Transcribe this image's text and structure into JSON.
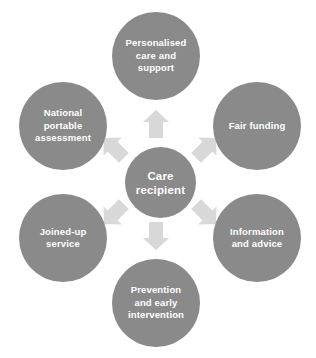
{
  "diagram": {
    "colors": {
      "circle_fill": "#8a8a8a",
      "label_text": "#ffffff",
      "arrow_fill": "#d8d8d8",
      "background": "#ffffff"
    },
    "center": {
      "id": "care-recipient",
      "label": "Care\nrecipient"
    },
    "nodes": [
      {
        "id": "personalised-care-and-support",
        "label": "Personalised\ncare and\nsupport",
        "position": "top"
      },
      {
        "id": "fair-funding",
        "label": "Fair funding",
        "position": "top-right"
      },
      {
        "id": "information-and-advice",
        "label": "Information\nand advice",
        "position": "bottom-right"
      },
      {
        "id": "prevention-and-early-intervention",
        "label": "Prevention\nand early\nintervention",
        "position": "bottom"
      },
      {
        "id": "joined-up-service",
        "label": "Joined-up\nservice",
        "position": "bottom-left"
      },
      {
        "id": "national-portable-assessment",
        "label": "National\nportable\nassessment",
        "position": "top-left"
      }
    ],
    "arrows": [
      {
        "id": "arrow-up",
        "direction": "up",
        "from": "care-recipient",
        "to": "personalised-care-and-support"
      },
      {
        "id": "arrow-up-right",
        "direction": "up-right",
        "from": "care-recipient",
        "to": "fair-funding"
      },
      {
        "id": "arrow-down-right",
        "direction": "down-right",
        "from": "care-recipient",
        "to": "information-and-advice"
      },
      {
        "id": "arrow-down",
        "direction": "down",
        "from": "care-recipient",
        "to": "prevention-and-early-intervention"
      },
      {
        "id": "arrow-down-left",
        "direction": "down-left",
        "from": "care-recipient",
        "to": "joined-up-service"
      },
      {
        "id": "arrow-up-left",
        "direction": "up-left",
        "from": "care-recipient",
        "to": "national-portable-assessment"
      }
    ]
  }
}
